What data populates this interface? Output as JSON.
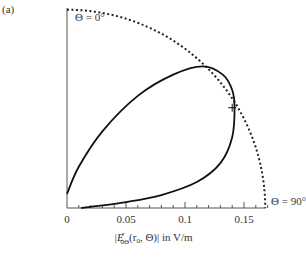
{
  "panel_label": "(a)",
  "chart_data": {
    "type": "line",
    "subtype": "polar-quadrant",
    "title": "",
    "xlabel": "|E^r_0Θ(r_0, Θ)| in V/m",
    "xlabel_parts": {
      "pre": "|E",
      "sup": "r",
      "sub": "0Θ",
      "post": "(r",
      "sub2": "0",
      "tail": ", Θ)| in V/m"
    },
    "ylabel": "",
    "xlim": [
      0,
      0.17
    ],
    "x_ticks": [
      0,
      0.05,
      0.1,
      0.15
    ],
    "x_tick_labels": [
      "0",
      "0.05",
      "0.1",
      "0.15"
    ],
    "minor_tick_step": 0.01,
    "grid": false,
    "annotations": [
      {
        "text": "Θ = 0°",
        "position": "top-left, along vertical axis"
      },
      {
        "text": "Θ = 90°",
        "position": "right end of horizontal axis"
      },
      {
        "text": "+",
        "meaning": "marker on curve",
        "x": 0.14,
        "y": 0.085
      }
    ],
    "series": [
      {
        "name": "reference circle (dashed)",
        "style": "dotted",
        "radius": 0.168,
        "theta_range_deg": [
          0,
          90
        ]
      },
      {
        "name": "field pattern",
        "style": "solid",
        "points_xy": [
          [
            0.0,
            0.012
          ],
          [
            0.01,
            0.035
          ],
          [
            0.03,
            0.065
          ],
          [
            0.06,
            0.095
          ],
          [
            0.09,
            0.113
          ],
          [
            0.115,
            0.12
          ],
          [
            0.132,
            0.113
          ],
          [
            0.14,
            0.1
          ],
          [
            0.142,
            0.085
          ],
          [
            0.14,
            0.06
          ],
          [
            0.13,
            0.038
          ],
          [
            0.11,
            0.022
          ],
          [
            0.08,
            0.011
          ],
          [
            0.05,
            0.005
          ],
          [
            0.02,
            0.001
          ],
          [
            0.012,
            0.0
          ]
        ]
      }
    ]
  }
}
